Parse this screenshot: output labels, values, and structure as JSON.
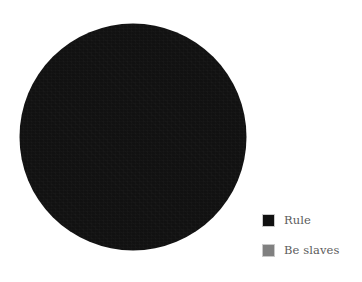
{
  "figure": {
    "background_color": "#ffffff",
    "width": 362,
    "height": 282
  },
  "legend": {
    "position": "right",
    "items": [
      {
        "label": "Rule",
        "color": "#111111",
        "swatch_name": "legend-swatch-rule"
      },
      {
        "label": "Be slaves",
        "color": "#808080",
        "swatch_name": "legend-swatch-be-slaves"
      }
    ]
  },
  "chart_data": {
    "type": "pie",
    "title": "",
    "labels": [
      "Rule",
      "Be slaves"
    ],
    "values": [
      100,
      0
    ],
    "percentages": [
      "100%",
      "0%"
    ],
    "colors": [
      "#111111",
      "#808080"
    ],
    "legend_position": "right",
    "start_angle": 90,
    "direction": "counterclockwise",
    "show_labels": false,
    "show_percent_labels": false,
    "grid": false,
    "center_x": 133,
    "center_y": 137,
    "radius": 114
  }
}
